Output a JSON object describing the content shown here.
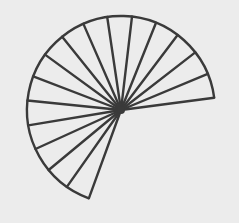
{
  "figure": {
    "type": "circular-sector-divided-into-wedges",
    "background": "#ececec",
    "stroke_color": "#3a3a3a",
    "stroke_width": 2.4,
    "center": [
      121,
      110
    ],
    "radius": 94,
    "start_angle_deg": 7.5,
    "end_angle_deg": 250,
    "wedge_count": 16,
    "radial_line_count": 17
  }
}
